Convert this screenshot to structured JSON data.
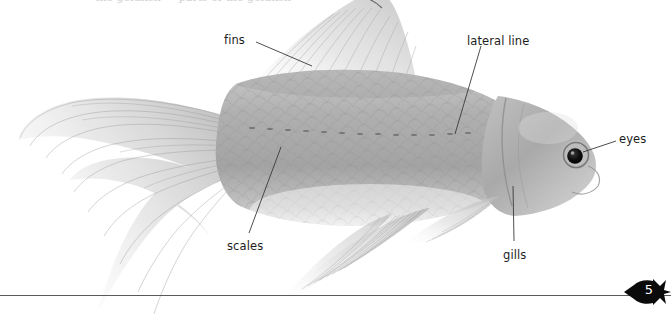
{
  "page": {
    "width": 671,
    "height": 317,
    "background_color": "#ffffff",
    "header_remnant_text": "the goldfish — parts of the goldfish",
    "rule_color": "#5a5a5a"
  },
  "figure": {
    "subject": "goldfish",
    "body_color": "#a8a8a8",
    "fin_color": "#d8d8d8",
    "eye_color": "#111111",
    "leader_line_color": "#3a3a3a"
  },
  "annotations": [
    {
      "id": "fins",
      "label": "fins",
      "label_x": 224,
      "label_y": 33,
      "leader": {
        "x1": 256,
        "y1": 42,
        "x2": 312,
        "y2": 66
      }
    },
    {
      "id": "lateral-line",
      "label": "lateral line",
      "label_x": 467,
      "label_y": 34,
      "leader": {
        "x1": 481,
        "y1": 46,
        "x2": 455,
        "y2": 134
      }
    },
    {
      "id": "eyes",
      "label": "eyes",
      "label_x": 619,
      "label_y": 132,
      "leader": {
        "x1": 616,
        "y1": 141,
        "x2": 583,
        "y2": 152
      }
    },
    {
      "id": "scales",
      "label": "scales",
      "label_x": 227,
      "label_y": 239,
      "leader": {
        "x1": 249,
        "y1": 233,
        "x2": 281,
        "y2": 147
      }
    },
    {
      "id": "gills",
      "label": "gills",
      "label_x": 503,
      "label_y": 248,
      "leader": {
        "x1": 514,
        "y1": 241,
        "x2": 513,
        "y2": 186
      }
    }
  ],
  "page_marker": {
    "number": "5",
    "shape": "fish-silhouette",
    "fill_color": "#0b0b0b",
    "text_color": "#ffffff"
  }
}
